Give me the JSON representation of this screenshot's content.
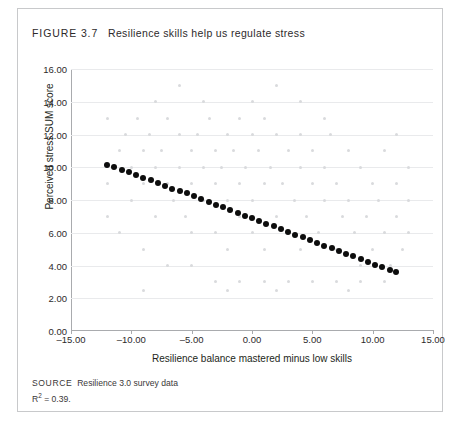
{
  "figure": {
    "label": "FIGURE 3.7",
    "title": "Resilience skills help us regulate stress",
    "source_keyword": "SOURCE",
    "source_text": "Resilience 3.0 survey data",
    "r_squared_prefix": "R",
    "r_squared_sup": "2",
    "r_squared_value": " = 0.39."
  },
  "chart_data": {
    "type": "scatter",
    "title": "Resilience skills help us regulate stress",
    "xlabel": "Resilience balance mastered minus low skills",
    "ylabel": "Perceived stress SUM score",
    "xlim": [
      -15,
      15
    ],
    "ylim": [
      0,
      16
    ],
    "xticks": [
      -15,
      -10,
      -5,
      0,
      5,
      10,
      15
    ],
    "xtick_labels": [
      "–15.00",
      "–10.00",
      "–5.00",
      "0.00",
      "5.00",
      "10.00",
      "15.00"
    ],
    "yticks": [
      0,
      2,
      4,
      6,
      8,
      10,
      12,
      14,
      16
    ],
    "ytick_labels": [
      "0.00",
      "2.00",
      "4.00",
      "6.00",
      "8.00",
      "10.00",
      "12.00",
      "14.00",
      "16.00"
    ],
    "grid": "horizontal",
    "legend": "none",
    "r_squared": 0.39,
    "series": [
      {
        "name": "Fitted trend (binned means)",
        "marker": "filled-circle",
        "color": "#0d0d0d",
        "size": 6,
        "points": [
          [
            -12.0,
            10.15
          ],
          [
            -11.4,
            10.0
          ],
          [
            -10.8,
            9.82
          ],
          [
            -10.2,
            9.68
          ],
          [
            -9.6,
            9.52
          ],
          [
            -9.0,
            9.36
          ],
          [
            -8.4,
            9.2
          ],
          [
            -7.8,
            9.02
          ],
          [
            -7.2,
            8.88
          ],
          [
            -6.6,
            8.7
          ],
          [
            -6.0,
            8.55
          ],
          [
            -5.4,
            8.4
          ],
          [
            -4.8,
            8.22
          ],
          [
            -4.2,
            8.05
          ],
          [
            -3.6,
            7.9
          ],
          [
            -3.0,
            7.72
          ],
          [
            -2.4,
            7.56
          ],
          [
            -1.8,
            7.4
          ],
          [
            -1.2,
            7.22
          ],
          [
            -0.6,
            7.05
          ],
          [
            0.0,
            6.9
          ],
          [
            0.6,
            6.72
          ],
          [
            1.2,
            6.56
          ],
          [
            1.8,
            6.4
          ],
          [
            2.4,
            6.22
          ],
          [
            3.0,
            6.05
          ],
          [
            3.6,
            5.88
          ],
          [
            4.2,
            5.72
          ],
          [
            4.8,
            5.56
          ],
          [
            5.4,
            5.38
          ],
          [
            6.0,
            5.22
          ],
          [
            6.6,
            5.05
          ],
          [
            7.2,
            4.9
          ],
          [
            7.8,
            4.72
          ],
          [
            8.4,
            4.56
          ],
          [
            9.0,
            4.4
          ],
          [
            9.6,
            4.22
          ],
          [
            10.2,
            4.05
          ],
          [
            10.8,
            3.9
          ],
          [
            11.4,
            3.72
          ],
          [
            11.9,
            3.6
          ]
        ]
      },
      {
        "name": "Individual survey responses",
        "marker": "filled-circle",
        "color": "#d9dadd",
        "size": 3,
        "points": [
          [
            -12.0,
            13.0
          ],
          [
            -11.0,
            11.0
          ],
          [
            -10.5,
            12.0
          ],
          [
            -10.0,
            10.0
          ],
          [
            -10.0,
            8.0
          ],
          [
            -9.5,
            13.0
          ],
          [
            -9.0,
            11.0
          ],
          [
            -9.0,
            9.0
          ],
          [
            -8.5,
            12.0
          ],
          [
            -8.0,
            10.0
          ],
          [
            -8.0,
            7.0
          ],
          [
            -7.5,
            11.0
          ],
          [
            -7.0,
            13.0
          ],
          [
            -7.0,
            9.0
          ],
          [
            -6.5,
            8.0
          ],
          [
            -6.0,
            12.0
          ],
          [
            -6.0,
            10.0
          ],
          [
            -5.5,
            7.0
          ],
          [
            -5.0,
            11.0
          ],
          [
            -5.0,
            9.0
          ],
          [
            -5.0,
            6.0
          ],
          [
            -4.5,
            12.0
          ],
          [
            -4.0,
            10.0
          ],
          [
            -4.0,
            8.0
          ],
          [
            -3.5,
            13.0
          ],
          [
            -3.0,
            11.0
          ],
          [
            -3.0,
            9.0
          ],
          [
            -3.0,
            6.0
          ],
          [
            -2.5,
            10.0
          ],
          [
            -2.0,
            12.0
          ],
          [
            -2.0,
            8.0
          ],
          [
            -2.0,
            5.0
          ],
          [
            -1.5,
            11.0
          ],
          [
            -1.0,
            13.0
          ],
          [
            -1.0,
            9.0
          ],
          [
            -1.0,
            7.0
          ],
          [
            -0.5,
            10.0
          ],
          [
            0.0,
            12.0
          ],
          [
            0.0,
            8.0
          ],
          [
            0.0,
            6.0
          ],
          [
            0.5,
            11.0
          ],
          [
            1.0,
            13.0
          ],
          [
            1.0,
            9.0
          ],
          [
            1.0,
            5.0
          ],
          [
            1.5,
            10.0
          ],
          [
            2.0,
            12.0
          ],
          [
            2.0,
            7.0
          ],
          [
            2.5,
            9.0
          ],
          [
            3.0,
            11.0
          ],
          [
            3.0,
            6.0
          ],
          [
            3.5,
            8.0
          ],
          [
            4.0,
            12.0
          ],
          [
            4.0,
            10.0
          ],
          [
            4.0,
            5.0
          ],
          [
            4.5,
            7.0
          ],
          [
            5.0,
            11.0
          ],
          [
            5.0,
            9.0
          ],
          [
            5.5,
            6.0
          ],
          [
            6.0,
            10.0
          ],
          [
            6.0,
            8.0
          ],
          [
            6.5,
            12.0
          ],
          [
            7.0,
            9.0
          ],
          [
            7.0,
            5.0
          ],
          [
            7.5,
            7.0
          ],
          [
            8.0,
            11.0
          ],
          [
            8.0,
            8.0
          ],
          [
            8.5,
            6.0
          ],
          [
            9.0,
            10.0
          ],
          [
            9.0,
            4.0
          ],
          [
            9.5,
            7.0
          ],
          [
            10.0,
            9.0
          ],
          [
            10.0,
            5.0
          ],
          [
            10.5,
            8.0
          ],
          [
            11.0,
            11.0
          ],
          [
            11.0,
            6.0
          ],
          [
            11.5,
            4.0
          ],
          [
            12.0,
            7.0
          ],
          [
            12.0,
            9.0
          ],
          [
            12.5,
            5.0
          ],
          [
            13.0,
            8.0
          ],
          [
            -11.0,
            6.0
          ],
          [
            -9.0,
            5.0
          ],
          [
            -7.0,
            4.0
          ],
          [
            -5.0,
            4.0
          ],
          [
            -3.0,
            3.0
          ],
          [
            -1.0,
            3.0
          ],
          [
            1.0,
            3.0
          ],
          [
            3.0,
            3.0
          ],
          [
            5.0,
            3.0
          ],
          [
            7.0,
            3.0
          ],
          [
            9.0,
            3.0
          ],
          [
            11.0,
            3.0
          ],
          [
            -8.0,
            14.0
          ],
          [
            -4.0,
            14.0
          ],
          [
            0.0,
            14.0
          ],
          [
            4.0,
            14.0
          ],
          [
            -6.0,
            15.0
          ],
          [
            2.0,
            15.0
          ],
          [
            6.0,
            13.0
          ],
          [
            12.0,
            12.0
          ],
          [
            -12.0,
            9.0
          ],
          [
            -12.0,
            7.0
          ],
          [
            13.0,
            6.0
          ],
          [
            13.0,
            10.0
          ],
          [
            -2.0,
            2.5
          ],
          [
            2.0,
            2.5
          ],
          [
            8.0,
            2.5
          ],
          [
            -9.0,
            2.5
          ]
        ]
      }
    ]
  }
}
